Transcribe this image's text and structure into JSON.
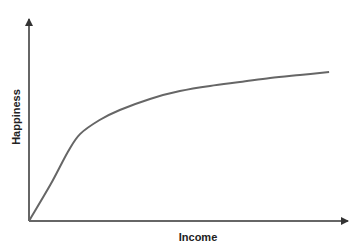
{
  "chart_data": {
    "type": "line",
    "title": "",
    "xlabel": "Income",
    "ylabel": "Happiness",
    "grid": false,
    "legend": null,
    "axis_ticks": false,
    "series": [
      {
        "name": "Happiness vs Income",
        "color": "#666666",
        "x": [
          0,
          0.066,
          0.121,
          0.159,
          0.22,
          0.283,
          0.377,
          0.47,
          0.564,
          0.657,
          0.751,
          0.844,
          0.935
        ],
        "y": [
          0,
          0.176,
          0.338,
          0.426,
          0.495,
          0.544,
          0.598,
          0.637,
          0.662,
          0.681,
          0.701,
          0.716,
          0.73
        ]
      }
    ],
    "xlim": [
      0,
      1
    ],
    "ylim": [
      0,
      1
    ]
  },
  "style": {
    "axis_color": "#333333",
    "curve_color": "#666666"
  }
}
